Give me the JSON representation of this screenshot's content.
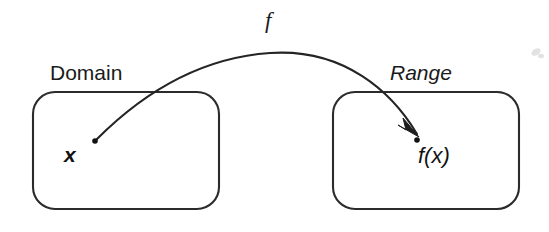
{
  "figure": {
    "background_color": "#ffffff",
    "stroke_color": "#2b2b2b",
    "width": 549,
    "height": 232
  },
  "labels": {
    "domain": "Domain",
    "range": "Range",
    "function": "f",
    "input_point": "x",
    "output_point": "f(x)"
  },
  "sets": [
    {
      "name": "domain-set",
      "label": "Domain",
      "label_style": "upright",
      "box": {
        "x": 33,
        "y": 92,
        "width": 186,
        "height": 117,
        "radius": 22
      }
    },
    {
      "name": "range-set",
      "label": "Range",
      "label_style": "italic",
      "box": {
        "x": 333,
        "y": 92,
        "width": 186,
        "height": 117,
        "radius": 22
      }
    }
  ],
  "points": [
    {
      "name": "input-point",
      "label": "x",
      "dot_x": 95,
      "dot_y": 141
    },
    {
      "name": "output-point",
      "label": "f(x)",
      "dot_x": 417,
      "dot_y": 140
    }
  ],
  "mapping_arrow": {
    "name": "function-arrow",
    "start_x": 97,
    "start_y": 139,
    "apex_x": 270,
    "apex_y": 53,
    "end_x": 419,
    "end_y": 137,
    "label": "f"
  },
  "artifacts": [
    {
      "name": "scan-smudge",
      "x": 535,
      "y": 53
    }
  ],
  "colors": {
    "ink": "#1a1a1a",
    "line": "#2b2b2b",
    "paper": "#ffffff"
  }
}
